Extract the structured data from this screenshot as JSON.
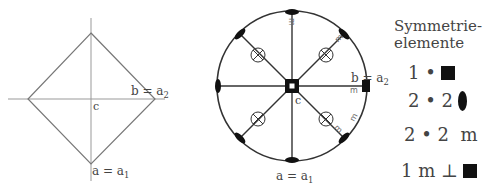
{
  "left_diagram": {
    "labels": {
      "b": "b = a",
      "b_sub": "2",
      "c": "c",
      "a": "a = a",
      "a_sub": "1"
    }
  },
  "stereogram": {
    "labels": {
      "b": "b = a",
      "b_sub": "2",
      "c": "c",
      "a": "a = a",
      "a_sub": "1",
      "m": "m"
    }
  },
  "legend": {
    "title_line1": "Symmetrie-",
    "title_line2": "elemente",
    "rows": [
      {
        "text": "1 •",
        "symbol": "square"
      },
      {
        "text": "2 • 2",
        "symbol": "ellipse"
      },
      {
        "text": "2 • 2  m",
        "symbol": "none"
      },
      {
        "text": "1 m ⊥",
        "symbol": "square"
      }
    ]
  }
}
